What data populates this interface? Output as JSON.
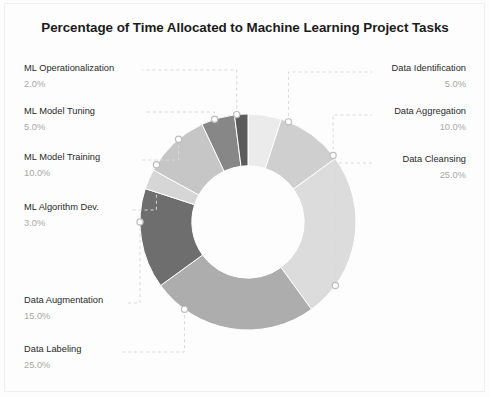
{
  "page": {
    "title": "Percentage of Time Allocated to Machine Learning Project Tasks",
    "background_color": "#fdfdfd",
    "frame_color": "#f0f0f0"
  },
  "chart_data": {
    "type": "pie",
    "variant": "donut",
    "title": "Percentage of Time Allocated to Machine Learning Project Tasks",
    "xlabel": "",
    "ylabel": "",
    "grid": false,
    "legend_position": "none",
    "label_style": "leader-lines-with-callouts",
    "start_angle_deg": 0,
    "direction": "clockwise",
    "hole_ratio": 0.52,
    "total": 100.0,
    "units": "%",
    "categories": [
      "Data Identification",
      "Data Aggregation",
      "Data Cleansing",
      "Data Labeling",
      "Data Augmentation",
      "ML Algorithm Dev.",
      "ML Model Training",
      "ML Model Tuning",
      "ML Operationalization"
    ],
    "values": [
      5.0,
      10.0,
      25.0,
      25.0,
      15.0,
      3.0,
      10.0,
      5.0,
      2.0
    ],
    "value_labels": [
      "5.0%",
      "10.0%",
      "25.0%",
      "25.0%",
      "15.0%",
      "3.0%",
      "10.0%",
      "5.0%",
      "2.0%"
    ],
    "colors": [
      "#ebebeb",
      "#cfcfcf",
      "#dcdcdc",
      "#adadad",
      "#6e6e6e",
      "#d6d6d6",
      "#c6c6c6",
      "#878787",
      "#5c5c5c"
    ],
    "slices": [
      {
        "label": "Data Identification",
        "value": 5.0,
        "value_label": "5.0%",
        "color": "#ebebeb",
        "side": "right"
      },
      {
        "label": "Data Aggregation",
        "value": 10.0,
        "value_label": "10.0%",
        "color": "#cfcfcf",
        "side": "right"
      },
      {
        "label": "Data Cleansing",
        "value": 25.0,
        "value_label": "25.0%",
        "color": "#dcdcdc",
        "side": "right"
      },
      {
        "label": "Data Labeling",
        "value": 25.0,
        "value_label": "25.0%",
        "color": "#adadad",
        "side": "left"
      },
      {
        "label": "Data Augmentation",
        "value": 15.0,
        "value_label": "15.0%",
        "color": "#6e6e6e",
        "side": "left"
      },
      {
        "label": "ML Algorithm Dev.",
        "value": 3.0,
        "value_label": "3.0%",
        "color": "#d6d6d6",
        "side": "left"
      },
      {
        "label": "ML Model Training",
        "value": 10.0,
        "value_label": "10.0%",
        "color": "#c6c6c6",
        "side": "left"
      },
      {
        "label": "ML Model Tuning",
        "value": 5.0,
        "value_label": "5.0%",
        "color": "#878787",
        "side": "left"
      },
      {
        "label": "ML Operationalization",
        "value": 2.0,
        "value_label": "2.0%",
        "color": "#5c5c5c",
        "side": "left"
      }
    ]
  },
  "labels": {
    "ml_operationalization": {
      "name": "ML Operationalization",
      "pct": "2.0%"
    },
    "ml_model_tuning": {
      "name": "ML Model Tuning",
      "pct": "5.0%"
    },
    "ml_model_training": {
      "name": "ML Model Training",
      "pct": "10.0%"
    },
    "ml_algorithm_dev": {
      "name": "ML Algorithm Dev.",
      "pct": "3.0%"
    },
    "data_augmentation": {
      "name": "Data Augmentation",
      "pct": "15.0%"
    },
    "data_labeling": {
      "name": "Data Labeling",
      "pct": "25.0%"
    },
    "data_identification": {
      "name": "Data Identification",
      "pct": "5.0%"
    },
    "data_aggregation": {
      "name": "Data Aggregation",
      "pct": "10.0%"
    },
    "data_cleansing": {
      "name": "Data Cleansing",
      "pct": "25.0%"
    }
  }
}
